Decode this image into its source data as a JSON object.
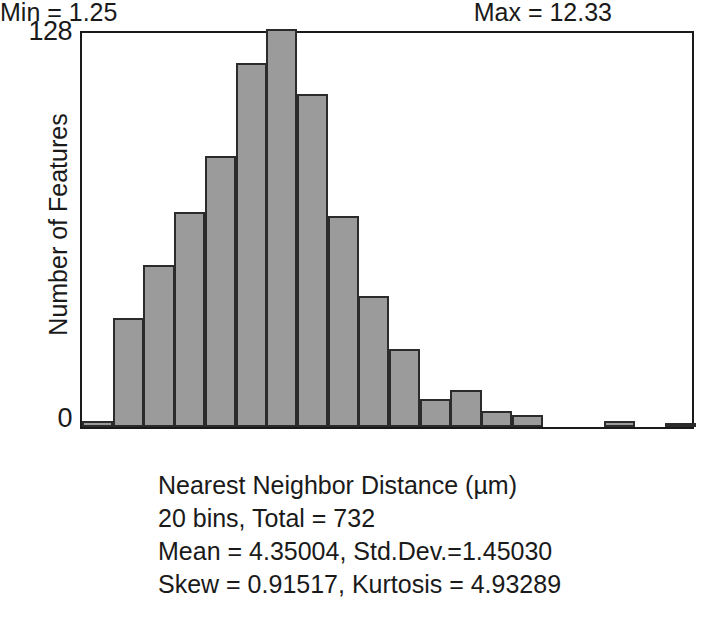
{
  "chart_data": {
    "type": "bar",
    "title": "",
    "subtitle": "",
    "xlabel": "Nearest Neighbor Distance (µm)",
    "ylabel": "Number of Features",
    "ylim": [
      0,
      128
    ],
    "xlim": [
      1.25,
      12.33
    ],
    "grid": false,
    "legend": null,
    "bin_count": 20,
    "total": 732,
    "categories": [
      "1.25–1.80",
      "1.80–2.35",
      "2.35–2.91",
      "2.91–3.46",
      "3.46–4.02",
      "4.02–4.57",
      "4.57–5.12",
      "5.12–5.68",
      "5.68–6.23",
      "6.23–6.79",
      "6.79–7.34",
      "7.34–7.89",
      "7.89–8.45",
      "8.45–9.00",
      "9.00–9.56",
      "9.56–10.11",
      "10.11–10.66",
      "10.66–11.22",
      "11.22–11.77",
      "11.77–12.33"
    ],
    "values": [
      2,
      35,
      52,
      69,
      87,
      117,
      128,
      107,
      68,
      42,
      25,
      9,
      12,
      5,
      4,
      0,
      0,
      2,
      0,
      1
    ],
    "ytick_labels": [
      "0",
      "128"
    ],
    "ytick_values": [
      0,
      128
    ]
  },
  "axis": {
    "y_top_label": "128",
    "y_zero_label": "0",
    "y_title": "Number of Features"
  },
  "caption": {
    "min_label": "Min = 1.25",
    "max_label": "Max = 12.33",
    "x_axis_title": "Nearest Neighbor Distance (µm)",
    "bins_total": "20 bins, Total = 732",
    "mean_stddev": "Mean = 4.35004, Std.Dev.=1.45030",
    "skew_kurtosis": "Skew = 0.91517, Kurtosis = 4.93289"
  },
  "style": {
    "bar_fill": "#9b9b9b",
    "bar_stroke": "#2b2b2b",
    "frame_color": "#1a1a1a",
    "background": "#ffffff",
    "text_color": "#1a1a1a"
  }
}
